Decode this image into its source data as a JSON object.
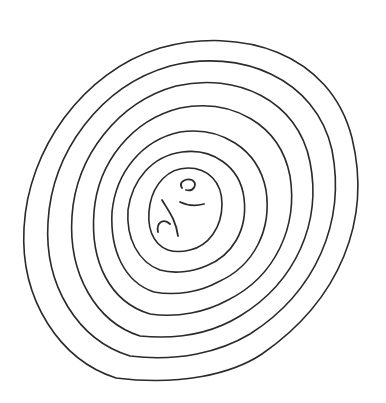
{
  "image": {
    "description": "Hand-drawn sketch of concentric wavy rings (tree-ring / topographic style) with small squiggles at the center",
    "ring_count": 7,
    "stroke_color": "#2a2a2a",
    "background_color": "#ffffff"
  }
}
